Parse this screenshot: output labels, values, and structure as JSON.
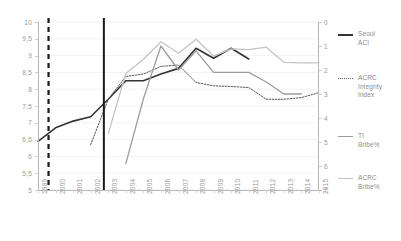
{
  "chart_data": {
    "type": "line",
    "title": "",
    "xlabel": "",
    "ylabel": "",
    "x": [
      1999,
      2000,
      2001,
      2002,
      2003,
      2004,
      2005,
      2006,
      2007,
      2008,
      2009,
      2010,
      2011,
      2012,
      2013,
      2014,
      2015
    ],
    "xtick_labels": [
      "1999",
      "2000",
      "2001",
      "2002",
      "2003",
      "2004",
      "2005",
      "2006",
      "2007",
      "2008",
      "2009",
      "2010",
      "2011",
      "2012",
      "2013",
      "2014",
      "2015"
    ],
    "left_axis": {
      "min": 5,
      "max": 10,
      "inverted": false,
      "ticks": [
        10,
        9.5,
        9,
        8.5,
        8,
        7.5,
        7,
        6.5,
        6,
        5.5,
        5
      ],
      "tick_labels": [
        "10",
        "9,5",
        "9",
        "8,5",
        "8",
        "7,5",
        "7",
        "6,5",
        "6",
        "5,5",
        "5"
      ]
    },
    "right_axis": {
      "min": 0,
      "max": 7,
      "inverted": true,
      "ticks": [
        0,
        1,
        2,
        3,
        4,
        5,
        6,
        7
      ],
      "tick_labels": [
        "0",
        "1",
        "2",
        "3",
        "4",
        "5",
        "6",
        "7"
      ]
    },
    "grid": true,
    "legend_position": "right",
    "series": [
      {
        "name": "Seoul ACI",
        "legend_label": "Seoul\nACI",
        "axis": "left",
        "style": "solid",
        "color": "#333333",
        "width": 1.6,
        "points": [
          {
            "x": 1999,
            "y": 6.45
          },
          {
            "x": 2000,
            "y": 6.85
          },
          {
            "x": 2001,
            "y": 7.05
          },
          {
            "x": 2002,
            "y": 7.18
          },
          {
            "x": 2003,
            "y": 7.7
          },
          {
            "x": 2004,
            "y": 8.25
          },
          {
            "x": 2005,
            "y": 8.25
          },
          {
            "x": 2006,
            "y": 8.45
          },
          {
            "x": 2007,
            "y": 8.62
          },
          {
            "x": 2008,
            "y": 9.22
          },
          {
            "x": 2009,
            "y": 8.92
          },
          {
            "x": 2010,
            "y": 9.22
          },
          {
            "x": 2011,
            "y": 8.9
          }
        ]
      },
      {
        "name": "ACRC Integrity Index",
        "legend_label": "ACRC\nIntegrity\nIndex",
        "axis": "left",
        "style": "dotted",
        "color": "#595959",
        "width": 1.0,
        "points": [
          {
            "x": 2002,
            "y": 6.35
          },
          {
            "x": 2003,
            "y": 7.7
          },
          {
            "x": 2004,
            "y": 8.38
          },
          {
            "x": 2005,
            "y": 8.45
          },
          {
            "x": 2006,
            "y": 8.68
          },
          {
            "x": 2007,
            "y": 8.72
          },
          {
            "x": 2008,
            "y": 8.2
          },
          {
            "x": 2009,
            "y": 8.1
          },
          {
            "x": 2010,
            "y": 8.08
          },
          {
            "x": 2011,
            "y": 8.05
          },
          {
            "x": 2012,
            "y": 7.7
          },
          {
            "x": 2013,
            "y": 7.7
          },
          {
            "x": 2014,
            "y": 7.75
          },
          {
            "x": 2015,
            "y": 7.9
          }
        ]
      },
      {
        "name": "TI Bribe%",
        "legend_label": "TI\nBribe%",
        "axis": "right",
        "style": "solid",
        "color": "#9c9c9c",
        "width": 1.3,
        "points": [
          {
            "x": 2004,
            "y": 5.9
          },
          {
            "x": 2005,
            "y": 3.2
          },
          {
            "x": 2006,
            "y": 1.0
          },
          {
            "x": 2007,
            "y": 2.0
          },
          {
            "x": 2008,
            "y": 1.2
          },
          {
            "x": 2009,
            "y": 2.1
          },
          {
            "x": 2010,
            "y": 2.1
          },
          {
            "x": 2011,
            "y": 2.1
          },
          {
            "x": 2012,
            "y": 2.5
          },
          {
            "x": 2013,
            "y": 3.0
          },
          {
            "x": 2014,
            "y": 3.0
          }
        ]
      },
      {
        "name": "ACRC Bribe%",
        "legend_label": "ACRC\nBribe%",
        "axis": "right",
        "style": "solid",
        "color": "#c4c4c4",
        "width": 1.3,
        "points": [
          {
            "x": 2003,
            "y": 4.65
          },
          {
            "x": 2004,
            "y": 2.15
          },
          {
            "x": 2005,
            "y": 1.55
          },
          {
            "x": 2006,
            "y": 0.82
          },
          {
            "x": 2007,
            "y": 1.3
          },
          {
            "x": 2008,
            "y": 0.72
          },
          {
            "x": 2009,
            "y": 1.42
          },
          {
            "x": 2010,
            "y": 1.12
          },
          {
            "x": 2011,
            "y": 1.15
          },
          {
            "x": 2012,
            "y": 1.05
          },
          {
            "x": 2013,
            "y": 1.68
          },
          {
            "x": 2014,
            "y": 1.7
          },
          {
            "x": 2015,
            "y": 1.7
          }
        ]
      }
    ],
    "reference_lines": [
      {
        "name": "dashed-marker",
        "x": 1999.6,
        "style": "dashed",
        "color": "#1a1a1a",
        "width": 2.2
      },
      {
        "name": "solid-marker",
        "x": 2002.75,
        "style": "solid",
        "color": "#1a1a1a",
        "width": 2.0
      }
    ]
  }
}
